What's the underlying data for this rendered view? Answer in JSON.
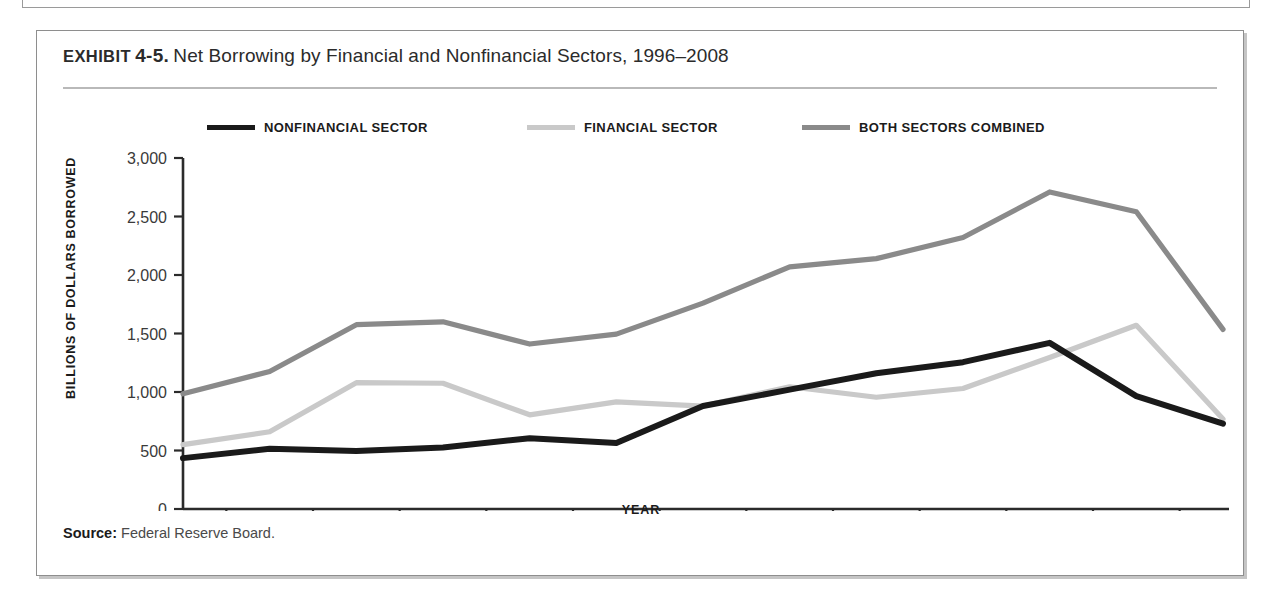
{
  "exhibit": {
    "kicker": "EXHIBIT",
    "number": "4-5.",
    "title": "Net Borrowing by Financial and Nonfinancial Sectors, 1996–2008",
    "source_label": "Source:",
    "source_text": "Federal Reserve Board."
  },
  "colors": {
    "nonfinancial": "#1a1a1a",
    "financial": "#c9c9c9",
    "combined": "#8a8a8a",
    "axis": "#2b2b2b",
    "frame": "#8e8e8e",
    "rule": "#b9b9b9"
  },
  "chart_data": {
    "type": "line",
    "title": "Net Borrowing by Financial and Nonfinancial Sectors, 1996–2008",
    "xlabel": "YEAR",
    "ylabel": "BILLIONS OF DOLLARS BORROWED",
    "categories": [
      "1996",
      "1997",
      "1998",
      "1999",
      "2000",
      "2001",
      "2002",
      "2003",
      "2004",
      "2005",
      "2006",
      "2007",
      "2008"
    ],
    "x": [
      1996,
      1997,
      1998,
      1999,
      2000,
      2001,
      2002,
      2003,
      2004,
      2005,
      2006,
      2007,
      2008
    ],
    "ylim": [
      0,
      3000
    ],
    "yticks": [
      0,
      500,
      1000,
      1500,
      2000,
      2500,
      3000
    ],
    "ytick_labels": [
      "0",
      "500",
      "1,000",
      "1,500",
      "2,000",
      "2,500",
      "3,000"
    ],
    "grid": false,
    "legend_position": "top",
    "series": [
      {
        "name": "NONFINANCIAL SECTOR",
        "color": "#1a1a1a",
        "values": [
          435,
          515,
          495,
          525,
          605,
          565,
          880,
          1020,
          1160,
          1255,
          1420,
          965,
          730
        ]
      },
      {
        "name": "FINANCIAL SECTOR",
        "color": "#c9c9c9",
        "values": [
          550,
          660,
          1080,
          1075,
          805,
          915,
          880,
          1045,
          955,
          1030,
          1295,
          1570,
          770
        ]
      },
      {
        "name": "BOTH SECTORS COMBINED",
        "color": "#8a8a8a",
        "values": [
          985,
          1175,
          1575,
          1600,
          1410,
          1495,
          1760,
          2070,
          2140,
          2320,
          2710,
          2540,
          1535
        ]
      }
    ]
  }
}
